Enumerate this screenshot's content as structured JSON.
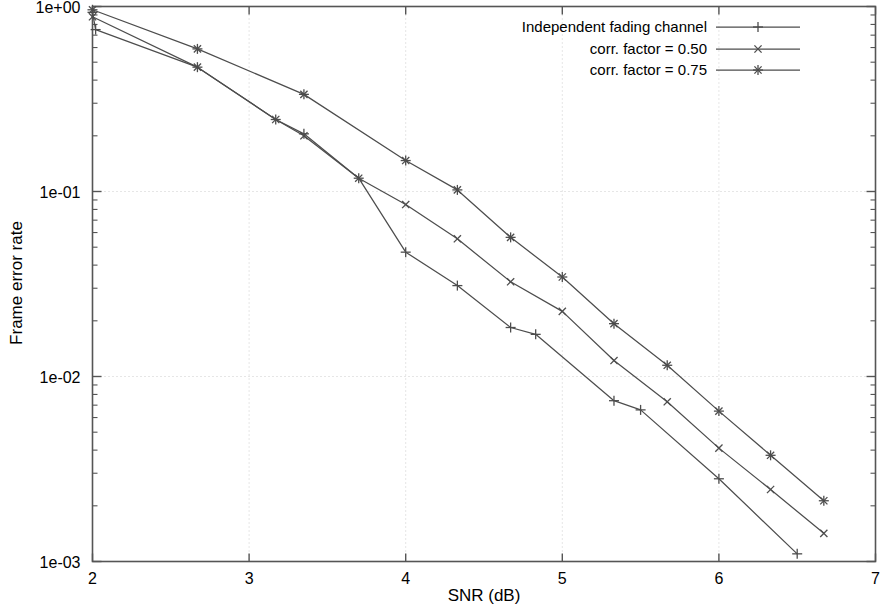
{
  "chart_data": {
    "type": "line",
    "title": "",
    "xlabel": "SNR (dB)",
    "ylabel": "Frame error rate",
    "xlim": [
      2,
      7
    ],
    "ylim": [
      0.001,
      1
    ],
    "yscale": "log",
    "xscale": "linear",
    "grid": true,
    "grid_style": "dotted",
    "legend_position": "top-right",
    "xticks": [
      "2",
      "3",
      "4",
      "5",
      "6",
      "7"
    ],
    "xtick_values": [
      2,
      3,
      4,
      5,
      6,
      7
    ],
    "yticks": [
      "1e+00",
      "1e-01",
      "1e-02",
      "1e-03"
    ],
    "ytick_values": [
      1,
      0.1,
      0.01,
      0.001
    ],
    "series": [
      {
        "name": "Independent fading channel",
        "marker": "plus",
        "color": "#4d4d4d",
        "x": [
          2.0,
          2.02,
          2.67,
          3.17,
          3.35,
          3.7,
          4.0,
          4.33,
          4.67,
          4.83,
          5.33,
          5.5,
          6.0,
          6.5
        ],
        "y": [
          0.93,
          0.75,
          0.47,
          0.245,
          0.205,
          0.118,
          0.047,
          0.031,
          0.0184,
          0.0169,
          0.0074,
          0.0066,
          0.0028,
          0.0011
        ]
      },
      {
        "name": "corr. factor = 0.50",
        "marker": "x",
        "color": "#4d4d4d",
        "x": [
          2.0,
          2.67,
          3.17,
          3.35,
          3.7,
          4.0,
          4.33,
          4.67,
          5.0,
          5.33,
          5.67,
          6.0,
          6.33,
          6.67
        ],
        "y": [
          0.88,
          0.47,
          0.245,
          0.2,
          0.118,
          0.085,
          0.0555,
          0.0325,
          0.0225,
          0.0122,
          0.0073,
          0.0041,
          0.00245,
          0.00142
        ]
      },
      {
        "name": "corr. factor = 0.75",
        "marker": "star",
        "color": "#4d4d4d",
        "x": [
          2.0,
          2.67,
          3.35,
          4.0,
          4.33,
          4.67,
          5.0,
          5.33,
          5.67,
          6.0,
          6.33,
          6.67
        ],
        "y": [
          0.96,
          0.59,
          0.335,
          0.147,
          0.102,
          0.0565,
          0.0345,
          0.0193,
          0.0115,
          0.0065,
          0.00375,
          0.00213
        ]
      }
    ]
  },
  "legend": {
    "entries": [
      {
        "label": "Independent fading channel",
        "marker": "plus"
      },
      {
        "label": "corr. factor = 0.50",
        "marker": "x"
      },
      {
        "label": "corr. factor = 0.75",
        "marker": "star"
      }
    ]
  },
  "colors": {
    "line": "#4d4d4d",
    "frame": "#555555",
    "grid": "#cccccc",
    "text": "#000000"
  }
}
